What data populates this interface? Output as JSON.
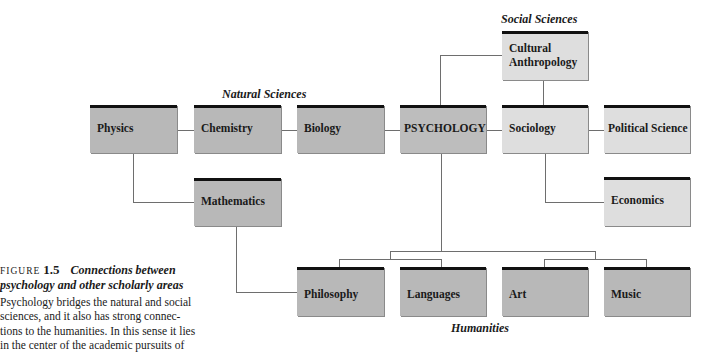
{
  "groups": {
    "natural_sciences": "Natural Sciences",
    "social_sciences": "Social Sciences",
    "humanities": "Humanities"
  },
  "nodes": {
    "physics": "Physics",
    "chemistry": "Chemistry",
    "biology": "Biology",
    "psychology": "PSYCHOLOGY",
    "sociology": "Sociology",
    "political_science": "Political Science",
    "cultural_anthropology_1": "Cultural",
    "cultural_anthropology_2": "Anthropology",
    "mathematics": "Mathematics",
    "economics": "Economics",
    "philosophy": "Philosophy",
    "languages": "Languages",
    "art": "Art",
    "music": "Music"
  },
  "caption": {
    "figure_label": "FIGURE",
    "figure_number": "1.5",
    "title_line1": "Connections between",
    "title_line2": "psychology and other scholarly areas",
    "body_lines": [
      "Psychology bridges the natural and social",
      "sciences, and it also has strong connec-",
      "tions to the humanities. In this sense it lies",
      "in the center of the academic pursuits of"
    ]
  },
  "colors": {
    "natural_box": "#b8b8b8",
    "psychology_box": "#bdbdbd",
    "social_box": "#dedede",
    "humanities_box": "#b8b8b8",
    "box_top_rule": "#111111",
    "connector": "#6e6e6e"
  }
}
